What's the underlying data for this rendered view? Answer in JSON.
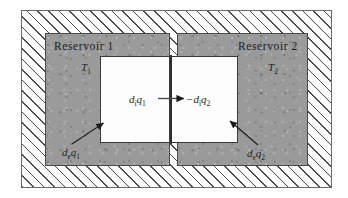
{
  "figure": {
    "kind": "thermodynamics-schematic",
    "background_color": "#ffffff",
    "hatch_color": "#4a4a4a",
    "reservoir_fill": "#9a9a9a",
    "chamber_fill": "#fdfdfd",
    "line_color": "#2e2e2e"
  },
  "outer_frame": {
    "name": "insulated-boundary",
    "hatched": true
  },
  "reservoirs": [
    {
      "title": "Reservoir 1",
      "temperature": "T",
      "temperature_sub": "1",
      "entropy_external": "d",
      "entropy_external_sub": "e",
      "entropy_external_q": "q",
      "entropy_external_q_sub": "1"
    },
    {
      "title": "Reservoir 2",
      "temperature": "T",
      "temperature_sub": "2",
      "entropy_external": "d",
      "entropy_external_sub": "e",
      "entropy_external_q": "q",
      "entropy_external_q_sub": "2"
    }
  ],
  "internal_flux": {
    "left_d": "d",
    "left_d_sub": "i",
    "left_q": "q",
    "left_q_sub": "1",
    "right_sign": "−",
    "right_d": "d",
    "right_d_sub": "i",
    "right_q": "q",
    "right_q_sub": "2",
    "arrow_direction": "right"
  },
  "arrows": {
    "internal_arrow": "arrow-right-internal-heat-flow",
    "left_external_arrow": "arrow-up-right-external-heat-left",
    "right_external_arrow": "arrow-up-left-external-heat-right"
  }
}
